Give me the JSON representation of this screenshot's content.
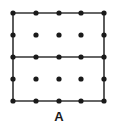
{
  "figure": {
    "label": "A",
    "grid": {
      "columns_x": [
        13,
        36,
        59,
        81,
        104
      ],
      "rows_y": [
        13,
        35,
        57,
        79,
        101
      ],
      "dot_radius": 2.6,
      "dot_color": "#1a1a1a"
    },
    "lines": [
      {
        "name": "rect-top",
        "x1": 13,
        "y1": 13,
        "x2": 104,
        "y2": 13
      },
      {
        "name": "rect-bottom",
        "x1": 13,
        "y1": 101,
        "x2": 104,
        "y2": 101
      },
      {
        "name": "rect-left",
        "x1": 13,
        "y1": 13,
        "x2": 13,
        "y2": 101
      },
      {
        "name": "rect-right",
        "x1": 104,
        "y1": 13,
        "x2": 104,
        "y2": 101
      },
      {
        "name": "middle-divider",
        "x1": 13,
        "y1": 57,
        "x2": 104,
        "y2": 57
      }
    ],
    "line_color": "#333333",
    "line_width": 1.6
  }
}
